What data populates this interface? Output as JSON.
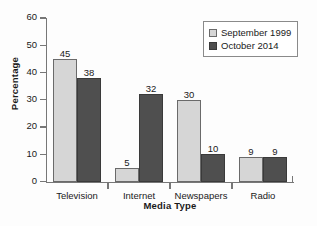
{
  "chart_data": {
    "type": "bar",
    "title": "",
    "xlabel": "Media Type",
    "ylabel": "Percentage",
    "categories": [
      "Television",
      "Internet",
      "Newspapers",
      "Radio"
    ],
    "series": [
      {
        "name": "September 1999",
        "values": [
          45,
          5,
          30,
          9
        ],
        "color": "#d6d6d6"
      },
      {
        "name": "October 2014",
        "values": [
          38,
          32,
          10,
          9
        ],
        "color": "#4f4f4f"
      }
    ],
    "ylim": [
      0,
      60
    ],
    "yticks": [
      0,
      10,
      20,
      30,
      40,
      50,
      60
    ],
    "ytick_labels": [
      "0",
      "10",
      "20",
      "30",
      "40",
      "50",
      "60"
    ],
    "grid": false,
    "legend_position": "top-right",
    "data_labels": true
  },
  "legend": {
    "items": [
      {
        "label": "September 1999",
        "swatch": "light"
      },
      {
        "label": "October 2014",
        "swatch": "dark"
      }
    ]
  }
}
